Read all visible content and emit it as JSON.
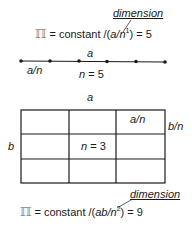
{
  "top": {
    "dimension_label": "dimension",
    "formula": {
      "symbol": "ℿ",
      "prefix": " = constant /(",
      "var": "a/n",
      "exp": "1",
      "suffix": ") = 5"
    },
    "line_label": "a",
    "segment_label": "a/n",
    "n_label": "n = 5",
    "dot_count": 6
  },
  "bottom": {
    "top_label": "a",
    "left_label": "b",
    "cell_label": "a/n",
    "side_label": "b/n",
    "n_label": "n = 3",
    "grid": {
      "rows": 3,
      "cols": 3
    },
    "dimension_label": "dimension",
    "formula": {
      "symbol": "ℿ",
      "prefix": " = constant /(",
      "var": "ab/n",
      "exp": "2",
      "suffix": ") = 9"
    }
  },
  "colors": {
    "stroke": "#1a1a1a",
    "symbol": "#888888"
  }
}
